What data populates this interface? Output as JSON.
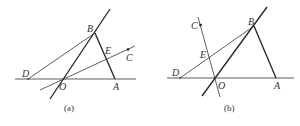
{
  "figures": [
    {
      "id": "a",
      "caption": "(a)",
      "labels": {
        "A": "A",
        "B": "B",
        "C": "C",
        "D": "D",
        "E": "E",
        "O": "O"
      }
    },
    {
      "id": "b",
      "caption": "(b)",
      "labels": {
        "A": "A",
        "B": "B",
        "C": "C",
        "D": "D",
        "E": "E",
        "O": "O"
      }
    }
  ],
  "colors": {
    "stroke": "#333333",
    "background": "#ffffff"
  }
}
